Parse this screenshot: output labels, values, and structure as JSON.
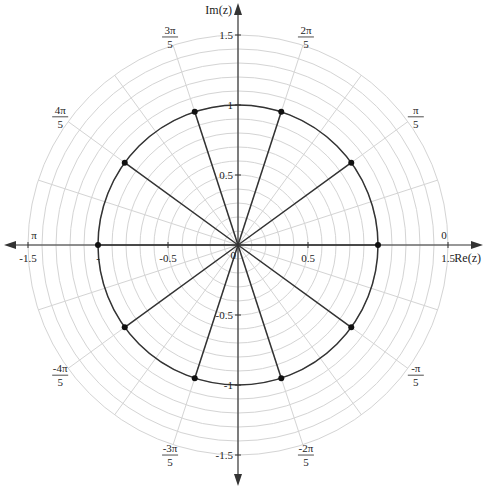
{
  "diagram": {
    "center_px": [
      238,
      245
    ],
    "unit_radius_px": 140,
    "grid": {
      "ring_step": 0.1,
      "ring_max": 1.5,
      "spoke_step_rad_over_pi": 0.1,
      "color": "#d4d4d4"
    },
    "unit_circle": {
      "radius": 1,
      "color": "#333333"
    },
    "axes": {
      "x_label": "Re(z)",
      "y_label": "Im(z)",
      "color": "#333333",
      "x_ticks": [
        {
          "value": -1.5,
          "label": "-1.5"
        },
        {
          "value": -1,
          "label": "-"
        },
        {
          "value": -0.5,
          "label": "-0.5"
        },
        {
          "value": 0.5,
          "label": "0.5"
        },
        {
          "value": 1.5,
          "label": "1.5"
        }
      ],
      "y_ticks": [
        {
          "value": 1.5,
          "label": "1.5"
        },
        {
          "value": 1,
          "label": "1"
        },
        {
          "value": 0.5,
          "label": "0.5"
        },
        {
          "value": -0.5,
          "label": "-0.5"
        },
        {
          "value": -1,
          "label": "-1"
        },
        {
          "value": -1.5,
          "label": "-1.5"
        }
      ],
      "origin_label": "0"
    },
    "angle_labels": [
      {
        "angle_over_pi": 0,
        "num": "0",
        "den": ""
      },
      {
        "angle_over_pi": 0.2,
        "num": "π",
        "den": "5"
      },
      {
        "angle_over_pi": 0.4,
        "num": "2π",
        "den": "5"
      },
      {
        "angle_over_pi": 0.6,
        "num": "3π",
        "den": "5"
      },
      {
        "angle_over_pi": 0.8,
        "num": "4π",
        "den": "5"
      },
      {
        "angle_over_pi": 1.0,
        "num": "π",
        "den": ""
      },
      {
        "angle_over_pi": -0.8,
        "num": "-4π",
        "den": "5"
      },
      {
        "angle_over_pi": -0.6,
        "num": "-3π",
        "den": "5"
      },
      {
        "angle_over_pi": -0.4,
        "num": "-2π",
        "den": "5"
      },
      {
        "angle_over_pi": -0.2,
        "num": "-π",
        "den": "5"
      }
    ],
    "points": [
      {
        "angle_over_pi": 0,
        "r": 1
      },
      {
        "angle_over_pi": 0.2,
        "r": 1
      },
      {
        "angle_over_pi": 0.4,
        "r": 1
      },
      {
        "angle_over_pi": 0.6,
        "r": 1
      },
      {
        "angle_over_pi": 0.8,
        "r": 1
      },
      {
        "angle_over_pi": 1.0,
        "r": 1
      },
      {
        "angle_over_pi": 1.2,
        "r": 1
      },
      {
        "angle_over_pi": 1.4,
        "r": 1
      },
      {
        "angle_over_pi": 1.6,
        "r": 1
      },
      {
        "angle_over_pi": 1.8,
        "r": 1
      }
    ]
  }
}
